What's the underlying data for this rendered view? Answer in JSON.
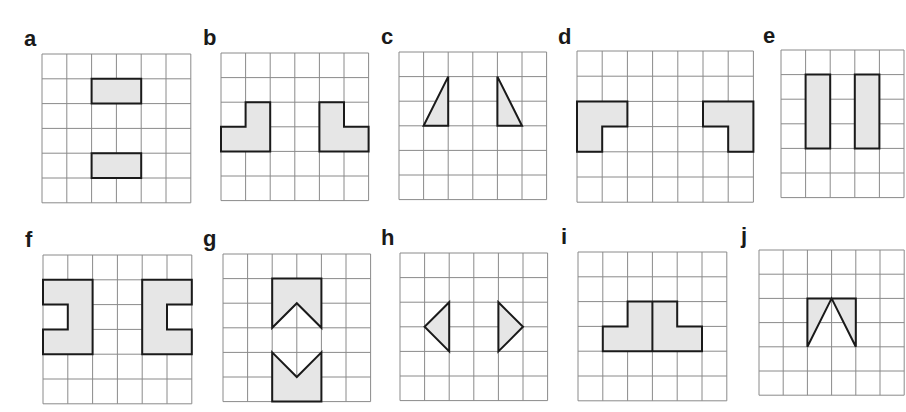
{
  "colors": {
    "grid_line": "#8a8a8a",
    "shape_fill": "#e6e6e6",
    "shape_stroke": "#1a1a1a",
    "label": "#1a1a1a"
  },
  "panels": [
    {
      "label": "a",
      "label_pos": [
        24,
        28
      ],
      "grid": {
        "x": 42,
        "y": 54,
        "cols": 6,
        "rows": 6,
        "cell": 24.8
      },
      "shapes": [
        [
          [
            2,
            1
          ],
          [
            4,
            1
          ],
          [
            4,
            2
          ],
          [
            2,
            2
          ]
        ],
        [
          [
            2,
            4
          ],
          [
            4,
            4
          ],
          [
            4,
            5
          ],
          [
            2,
            5
          ]
        ]
      ]
    },
    {
      "label": "b",
      "label_pos": [
        203,
        27
      ],
      "grid": {
        "x": 221,
        "y": 53,
        "cols": 6,
        "rows": 6,
        "cell": 24.6
      },
      "shapes": [
        [
          [
            1,
            2
          ],
          [
            2,
            2
          ],
          [
            2,
            4
          ],
          [
            0,
            4
          ],
          [
            0,
            3
          ],
          [
            1,
            3
          ]
        ],
        [
          [
            4,
            2
          ],
          [
            5,
            2
          ],
          [
            5,
            3
          ],
          [
            6,
            3
          ],
          [
            6,
            4
          ],
          [
            4,
            4
          ]
        ]
      ]
    },
    {
      "label": "c",
      "label_pos": [
        381,
        26
      ],
      "grid": {
        "x": 399,
        "y": 52,
        "cols": 6,
        "rows": 6,
        "cell": 24.6
      },
      "shapes": [
        [
          [
            2,
            1
          ],
          [
            2,
            3
          ],
          [
            1,
            3
          ]
        ],
        [
          [
            4,
            1
          ],
          [
            5,
            3
          ],
          [
            4,
            3
          ]
        ]
      ]
    },
    {
      "label": "d",
      "label_pos": [
        558,
        26
      ],
      "grid": {
        "x": 577,
        "y": 51,
        "cols": 7,
        "rows": 6,
        "cell": 25.2
      },
      "shapes": [
        [
          [
            0,
            2
          ],
          [
            2,
            2
          ],
          [
            2,
            3
          ],
          [
            1,
            3
          ],
          [
            1,
            4
          ],
          [
            0,
            4
          ]
        ],
        [
          [
            5,
            2
          ],
          [
            7,
            2
          ],
          [
            7,
            4
          ],
          [
            6,
            4
          ],
          [
            6,
            3
          ],
          [
            5,
            3
          ]
        ]
      ]
    },
    {
      "label": "e",
      "label_pos": [
        763,
        25
      ],
      "grid": {
        "x": 781,
        "y": 50,
        "cols": 5,
        "rows": 6,
        "cell": 24.6
      },
      "shapes": [
        [
          [
            1,
            1
          ],
          [
            2,
            1
          ],
          [
            2,
            4
          ],
          [
            1,
            4
          ]
        ],
        [
          [
            3,
            1
          ],
          [
            4,
            1
          ],
          [
            4,
            4
          ],
          [
            3,
            4
          ]
        ]
      ]
    },
    {
      "label": "f",
      "label_pos": [
        25,
        229
      ],
      "grid": {
        "x": 43,
        "y": 255,
        "cols": 6,
        "rows": 6,
        "cell": 24.8
      },
      "shapes": [
        [
          [
            0,
            1
          ],
          [
            2,
            1
          ],
          [
            2,
            4
          ],
          [
            0,
            4
          ],
          [
            0,
            3
          ],
          [
            1,
            3
          ],
          [
            1,
            2
          ],
          [
            0,
            2
          ]
        ],
        [
          [
            4,
            1
          ],
          [
            6,
            1
          ],
          [
            6,
            2
          ],
          [
            5,
            2
          ],
          [
            5,
            3
          ],
          [
            6,
            3
          ],
          [
            6,
            4
          ],
          [
            4,
            4
          ]
        ]
      ]
    },
    {
      "label": "g",
      "label_pos": [
        203,
        228
      ],
      "grid": {
        "x": 223,
        "y": 254,
        "cols": 6,
        "rows": 6,
        "cell": 24.6
      },
      "shapes": [
        [
          [
            2,
            1
          ],
          [
            4,
            1
          ],
          [
            4,
            3
          ],
          [
            3,
            2
          ],
          [
            2,
            3
          ]
        ],
        [
          [
            2,
            4
          ],
          [
            3,
            5
          ],
          [
            4,
            4
          ],
          [
            4,
            6
          ],
          [
            2,
            6
          ]
        ]
      ]
    },
    {
      "label": "h",
      "label_pos": [
        381,
        227
      ],
      "grid": {
        "x": 400,
        "y": 253,
        "cols": 6,
        "rows": 6,
        "cell": 24.6
      },
      "shapes": [
        [
          [
            2,
            2
          ],
          [
            2,
            4
          ],
          [
            1,
            3
          ]
        ],
        [
          [
            4,
            2
          ],
          [
            5,
            3
          ],
          [
            4,
            4
          ]
        ]
      ]
    },
    {
      "label": "i",
      "label_pos": [
        561,
        226
      ],
      "grid": {
        "x": 578,
        "y": 252,
        "cols": 6,
        "rows": 6,
        "cell": 24.8
      },
      "shapes": [
        [
          [
            2,
            2
          ],
          [
            4,
            2
          ],
          [
            4,
            3
          ],
          [
            5,
            3
          ],
          [
            5,
            4
          ],
          [
            1,
            4
          ],
          [
            1,
            3
          ],
          [
            2,
            3
          ]
        ]
      ],
      "inner_lines": [
        [
          [
            3,
            2
          ],
          [
            3,
            4
          ]
        ]
      ]
    },
    {
      "label": "j",
      "label_pos": [
        741,
        225
      ],
      "grid": {
        "x": 759,
        "y": 250,
        "cols": 6,
        "rows": 6,
        "cell": 24.2
      },
      "shapes": [
        [
          [
            2,
            2
          ],
          [
            4,
            2
          ],
          [
            4,
            4
          ],
          [
            3,
            2
          ],
          [
            2,
            4
          ]
        ]
      ]
    }
  ]
}
